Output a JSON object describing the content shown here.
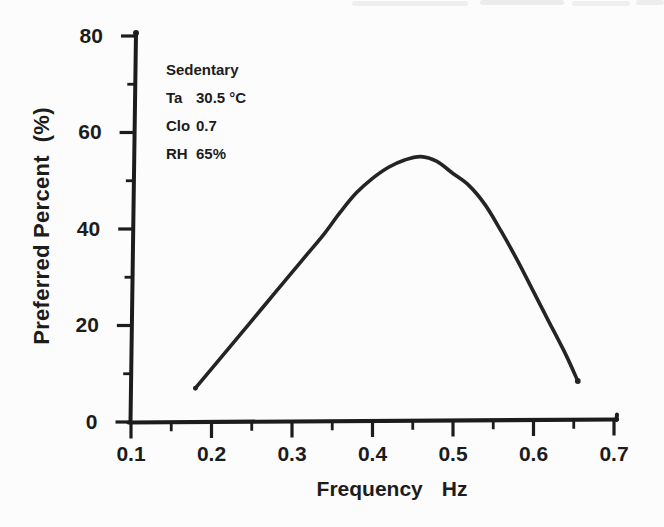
{
  "figure": {
    "background": "#fcfcfc",
    "ink_color": "#1c1c1c",
    "curve_color": "#242424"
  },
  "annotation": {
    "title": "Sedentary",
    "rows": [
      {
        "label": "Ta",
        "value": "30.5 °C"
      },
      {
        "label": "Clo",
        "value": "0.7"
      },
      {
        "label": "RH",
        "value": "65%"
      }
    ]
  },
  "chart_data": {
    "type": "line",
    "title": "",
    "xlabel": "Frequency Hz",
    "xlabel_word": "Frequency",
    "xlabel_unit": "Hz",
    "ylabel": "Preferred Percent  (%)",
    "xlim": [
      0.1,
      0.7
    ],
    "ylim": [
      0,
      80
    ],
    "grid": false,
    "legend": "none",
    "x_ticks": {
      "major": [
        0.1,
        0.2,
        0.3,
        0.4,
        0.5,
        0.6,
        0.7
      ],
      "labels": [
        "0.1",
        "0.2",
        "0.3",
        "0.4",
        "0.5",
        "0.6",
        "0.7"
      ],
      "minor": [
        0.15,
        0.25,
        0.35,
        0.45,
        0.55,
        0.65
      ]
    },
    "y_ticks": {
      "major": [
        0,
        20,
        40,
        60,
        80
      ],
      "labels": [
        "0",
        "20",
        "40",
        "60",
        "80"
      ],
      "minor": [
        10,
        30,
        50,
        70
      ]
    },
    "series": [
      {
        "name": "Preferred percent vs frequency",
        "x": [
          0.18,
          0.2,
          0.22,
          0.24,
          0.26,
          0.28,
          0.3,
          0.32,
          0.34,
          0.36,
          0.38,
          0.4,
          0.42,
          0.44,
          0.46,
          0.48,
          0.5,
          0.52,
          0.54,
          0.56,
          0.58,
          0.6,
          0.62,
          0.64,
          0.655
        ],
        "y": [
          7,
          11,
          15,
          19,
          23,
          27,
          31,
          35,
          39,
          43.5,
          47.5,
          50.5,
          52.8,
          54.3,
          55,
          54,
          51.5,
          49,
          45,
          39.5,
          33.5,
          27,
          20.5,
          14,
          8.5
        ]
      }
    ],
    "annotations": [
      "Sedentary",
      "Ta 30.5 °C",
      "Clo 0.7",
      "RH 65%"
    ],
    "peak": {
      "x": 0.46,
      "y": 55
    }
  }
}
